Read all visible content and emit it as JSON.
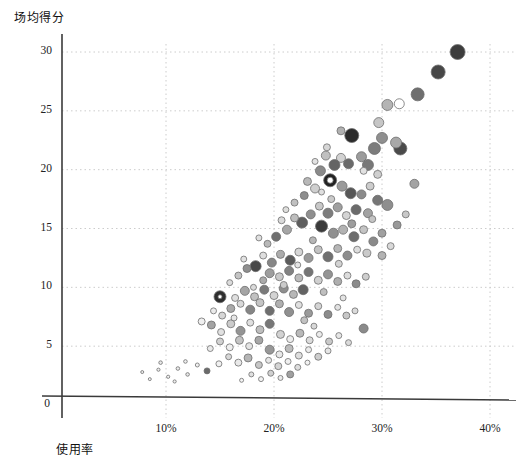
{
  "chart_data": {
    "type": "scatter",
    "title": "",
    "subtitle": "",
    "xlabel": "使用率",
    "ylabel": "场均得分",
    "xlim": [
      0.045,
      0.425
    ],
    "ylim": [
      0,
      31.5
    ],
    "grid": true,
    "legend": "none",
    "x_ticks": [
      "10%",
      "20%",
      "30%",
      "40%"
    ],
    "x_tick_values": [
      0.1,
      0.2,
      0.3,
      0.4
    ],
    "y_ticks": [
      "0",
      "5",
      "10",
      "15",
      "20",
      "25",
      "30"
    ],
    "y_tick_values": [
      0,
      5,
      10,
      15,
      20,
      25,
      30
    ],
    "marker_note": "bubble sizes vary by minutes played; grayscale fill varies per point",
    "colors": {
      "background": "#ffffff",
      "axis": "#3a3a3a",
      "grid": "#cccccc",
      "text": "#1a1a1a",
      "marker_dark": "#2f2f2f",
      "marker_mid": "#8c8c8c",
      "marker_light": "#d8d8d8",
      "marker_stroke": "#6e6e6e"
    },
    "points": [
      {
        "x": 0.37,
        "y": 30.0,
        "r": 7.5,
        "c": "#3d3d3d"
      },
      {
        "x": 0.352,
        "y": 28.3,
        "r": 7.0,
        "c": "#474747"
      },
      {
        "x": 0.333,
        "y": 26.4,
        "r": 6.5,
        "c": "#6f6f6f"
      },
      {
        "x": 0.316,
        "y": 25.6,
        "r": 5.0,
        "c": "#ffffff"
      },
      {
        "x": 0.305,
        "y": 25.5,
        "r": 5.5,
        "c": "#b4b4b4"
      },
      {
        "x": 0.297,
        "y": 24.0,
        "r": 5.0,
        "c": "#c6c6c6"
      },
      {
        "x": 0.3,
        "y": 22.7,
        "r": 5.5,
        "c": "#8f8f8f"
      },
      {
        "x": 0.293,
        "y": 21.8,
        "r": 6.0,
        "c": "#7c7c7c"
      },
      {
        "x": 0.317,
        "y": 21.8,
        "r": 6.5,
        "c": "#4a4a4a"
      },
      {
        "x": 0.313,
        "y": 22.3,
        "r": 5.5,
        "c": "#a8a8a8"
      },
      {
        "x": 0.272,
        "y": 22.9,
        "r": 7.0,
        "c": "#2b2b2b"
      },
      {
        "x": 0.281,
        "y": 21.1,
        "r": 5.0,
        "c": "#9c9c9c"
      },
      {
        "x": 0.287,
        "y": 20.4,
        "r": 5.5,
        "c": "#787878"
      },
      {
        "x": 0.269,
        "y": 20.5,
        "r": 5.0,
        "c": "#6a6a6a"
      },
      {
        "x": 0.262,
        "y": 21.0,
        "r": 4.5,
        "c": "#d2d2d2"
      },
      {
        "x": 0.256,
        "y": 20.4,
        "r": 5.5,
        "c": "#646464"
      },
      {
        "x": 0.248,
        "y": 21.2,
        "r": 4.5,
        "c": "#c0c0c0"
      },
      {
        "x": 0.243,
        "y": 19.9,
        "r": 5.0,
        "c": "#8a8a8a"
      },
      {
        "x": 0.252,
        "y": 19.1,
        "r": 6.5,
        "c": "#222222"
      },
      {
        "x": 0.252,
        "y": 19.1,
        "r": 3.0,
        "c": "#ffffff"
      },
      {
        "x": 0.238,
        "y": 18.4,
        "r": 4.5,
        "c": "#cfcfcf"
      },
      {
        "x": 0.231,
        "y": 19.0,
        "r": 4.0,
        "c": "#b8b8b8"
      },
      {
        "x": 0.263,
        "y": 18.6,
        "r": 5.0,
        "c": "#9a9a9a"
      },
      {
        "x": 0.271,
        "y": 18.0,
        "r": 5.5,
        "c": "#575757"
      },
      {
        "x": 0.281,
        "y": 17.9,
        "r": 4.5,
        "c": "#8b8b8b"
      },
      {
        "x": 0.289,
        "y": 18.6,
        "r": 4.0,
        "c": "#cdcdcd"
      },
      {
        "x": 0.296,
        "y": 17.4,
        "r": 5.0,
        "c": "#767676"
      },
      {
        "x": 0.305,
        "y": 17.0,
        "r": 5.5,
        "c": "#8e8e8e"
      },
      {
        "x": 0.287,
        "y": 16.3,
        "r": 4.5,
        "c": "#a2a2a2"
      },
      {
        "x": 0.276,
        "y": 16.6,
        "r": 5.0,
        "c": "#6b6b6b"
      },
      {
        "x": 0.267,
        "y": 16.1,
        "r": 4.0,
        "c": "#d4d4d4"
      },
      {
        "x": 0.259,
        "y": 16.8,
        "r": 4.5,
        "c": "#9f9f9f"
      },
      {
        "x": 0.25,
        "y": 16.3,
        "r": 5.0,
        "c": "#7d7d7d"
      },
      {
        "x": 0.242,
        "y": 16.9,
        "r": 4.0,
        "c": "#c8c8c8"
      },
      {
        "x": 0.234,
        "y": 16.2,
        "r": 4.5,
        "c": "#8f8f8f"
      },
      {
        "x": 0.226,
        "y": 15.5,
        "r": 5.5,
        "c": "#5e5e5e"
      },
      {
        "x": 0.219,
        "y": 15.9,
        "r": 4.0,
        "c": "#bdbdbd"
      },
      {
        "x": 0.212,
        "y": 14.9,
        "r": 4.5,
        "c": "#a6a6a6"
      },
      {
        "x": 0.207,
        "y": 15.7,
        "r": 3.5,
        "c": "#dadada"
      },
      {
        "x": 0.244,
        "y": 15.2,
        "r": 6.0,
        "c": "#3a3a3a"
      },
      {
        "x": 0.255,
        "y": 14.6,
        "r": 5.0,
        "c": "#909090"
      },
      {
        "x": 0.264,
        "y": 14.9,
        "r": 4.5,
        "c": "#b2b2b2"
      },
      {
        "x": 0.274,
        "y": 14.3,
        "r": 5.0,
        "c": "#6d6d6d"
      },
      {
        "x": 0.283,
        "y": 14.9,
        "r": 4.0,
        "c": "#c4c4c4"
      },
      {
        "x": 0.292,
        "y": 13.9,
        "r": 4.5,
        "c": "#8a8a8a"
      },
      {
        "x": 0.3,
        "y": 14.6,
        "r": 4.0,
        "c": "#a0a0a0"
      },
      {
        "x": 0.286,
        "y": 12.9,
        "r": 4.0,
        "c": "#cacaca"
      },
      {
        "x": 0.277,
        "y": 13.2,
        "r": 3.5,
        "c": "#dddddd"
      },
      {
        "x": 0.268,
        "y": 12.7,
        "r": 4.5,
        "c": "#8d8d8d"
      },
      {
        "x": 0.259,
        "y": 13.3,
        "r": 4.0,
        "c": "#b6b6b6"
      },
      {
        "x": 0.25,
        "y": 12.6,
        "r": 5.0,
        "c": "#707070"
      },
      {
        "x": 0.241,
        "y": 13.2,
        "r": 4.0,
        "c": "#c2c2c2"
      },
      {
        "x": 0.232,
        "y": 12.5,
        "r": 4.5,
        "c": "#999999"
      },
      {
        "x": 0.223,
        "y": 13.0,
        "r": 4.0,
        "c": "#d6d6d6"
      },
      {
        "x": 0.215,
        "y": 12.3,
        "r": 5.0,
        "c": "#5b5b5b"
      },
      {
        "x": 0.206,
        "y": 12.8,
        "r": 4.0,
        "c": "#acacac"
      },
      {
        "x": 0.198,
        "y": 12.1,
        "r": 4.5,
        "c": "#868686"
      },
      {
        "x": 0.19,
        "y": 12.7,
        "r": 3.5,
        "c": "#dedede"
      },
      {
        "x": 0.183,
        "y": 11.8,
        "r": 5.5,
        "c": "#494949"
      },
      {
        "x": 0.196,
        "y": 11.2,
        "r": 4.5,
        "c": "#9e9e9e"
      },
      {
        "x": 0.205,
        "y": 10.9,
        "r": 4.0,
        "c": "#c9c9c9"
      },
      {
        "x": 0.214,
        "y": 11.4,
        "r": 4.5,
        "c": "#828282"
      },
      {
        "x": 0.223,
        "y": 10.8,
        "r": 4.0,
        "c": "#bbbbbb"
      },
      {
        "x": 0.232,
        "y": 11.3,
        "r": 4.5,
        "c": "#757575"
      },
      {
        "x": 0.241,
        "y": 10.6,
        "r": 4.0,
        "c": "#d0d0d0"
      },
      {
        "x": 0.25,
        "y": 11.1,
        "r": 4.5,
        "c": "#949494"
      },
      {
        "x": 0.259,
        "y": 10.5,
        "r": 4.0,
        "c": "#aeaeae"
      },
      {
        "x": 0.268,
        "y": 11.0,
        "r": 3.5,
        "c": "#dcdcdc"
      },
      {
        "x": 0.276,
        "y": 10.3,
        "r": 4.0,
        "c": "#8b8b8b"
      },
      {
        "x": 0.285,
        "y": 10.9,
        "r": 3.5,
        "c": "#cecece"
      },
      {
        "x": 0.227,
        "y": 9.8,
        "r": 5.0,
        "c": "#636363"
      },
      {
        "x": 0.218,
        "y": 9.4,
        "r": 4.0,
        "c": "#b7b7b7"
      },
      {
        "x": 0.209,
        "y": 9.9,
        "r": 4.5,
        "c": "#8f8f8f"
      },
      {
        "x": 0.2,
        "y": 9.3,
        "r": 4.0,
        "c": "#d3d3d3"
      },
      {
        "x": 0.191,
        "y": 9.8,
        "r": 4.5,
        "c": "#7a7a7a"
      },
      {
        "x": 0.182,
        "y": 9.2,
        "r": 4.0,
        "c": "#c1c1c1"
      },
      {
        "x": 0.173,
        "y": 9.7,
        "r": 4.5,
        "c": "#a5a5a5"
      },
      {
        "x": 0.164,
        "y": 9.1,
        "r": 3.5,
        "c": "#dfdfdf"
      },
      {
        "x": 0.15,
        "y": 9.2,
        "r": 6.0,
        "c": "#2e2e2e"
      },
      {
        "x": 0.15,
        "y": 9.2,
        "r": 2.0,
        "c": "#ffffff"
      },
      {
        "x": 0.16,
        "y": 8.2,
        "r": 4.0,
        "c": "#a9a9a9"
      },
      {
        "x": 0.169,
        "y": 8.6,
        "r": 3.5,
        "c": "#d8d8d8"
      },
      {
        "x": 0.178,
        "y": 8.1,
        "r": 4.5,
        "c": "#858585"
      },
      {
        "x": 0.187,
        "y": 8.7,
        "r": 4.0,
        "c": "#c5c5c5"
      },
      {
        "x": 0.196,
        "y": 8.0,
        "r": 4.5,
        "c": "#6e6e6e"
      },
      {
        "x": 0.205,
        "y": 8.6,
        "r": 4.0,
        "c": "#b0b0b0"
      },
      {
        "x": 0.214,
        "y": 7.9,
        "r": 4.5,
        "c": "#909090"
      },
      {
        "x": 0.223,
        "y": 8.5,
        "r": 3.5,
        "c": "#e0e0e0"
      },
      {
        "x": 0.232,
        "y": 7.8,
        "r": 4.0,
        "c": "#9b9b9b"
      },
      {
        "x": 0.241,
        "y": 8.4,
        "r": 3.5,
        "c": "#d5d5d5"
      },
      {
        "x": 0.25,
        "y": 7.7,
        "r": 4.0,
        "c": "#8c8c8c"
      },
      {
        "x": 0.259,
        "y": 8.3,
        "r": 3.0,
        "c": "#e2e2e2"
      },
      {
        "x": 0.267,
        "y": 7.6,
        "r": 3.5,
        "c": "#c7c7c7"
      },
      {
        "x": 0.275,
        "y": 8.0,
        "r": 3.0,
        "c": "#dbdbdb"
      },
      {
        "x": 0.283,
        "y": 6.5,
        "r": 4.5,
        "c": "#8a8a8a"
      },
      {
        "x": 0.196,
        "y": 6.9,
        "r": 4.5,
        "c": "#777777"
      },
      {
        "x": 0.187,
        "y": 6.4,
        "r": 4.0,
        "c": "#bebebe"
      },
      {
        "x": 0.178,
        "y": 7.0,
        "r": 3.5,
        "c": "#dfdfdf"
      },
      {
        "x": 0.169,
        "y": 6.3,
        "r": 4.5,
        "c": "#949494"
      },
      {
        "x": 0.16,
        "y": 6.9,
        "r": 4.0,
        "c": "#cbcbcb"
      },
      {
        "x": 0.151,
        "y": 6.2,
        "r": 3.5,
        "c": "#e1e1e1"
      },
      {
        "x": 0.142,
        "y": 6.8,
        "r": 4.0,
        "c": "#a3a3a3"
      },
      {
        "x": 0.133,
        "y": 7.1,
        "r": 3.5,
        "c": "#f0f0f0"
      },
      {
        "x": 0.206,
        "y": 6.0,
        "r": 4.0,
        "c": "#d2d2d2"
      },
      {
        "x": 0.215,
        "y": 5.6,
        "r": 3.5,
        "c": "#ededed"
      },
      {
        "x": 0.224,
        "y": 6.1,
        "r": 4.0,
        "c": "#b9b9b9"
      },
      {
        "x": 0.233,
        "y": 5.5,
        "r": 3.5,
        "c": "#dcdcdc"
      },
      {
        "x": 0.242,
        "y": 6.0,
        "r": 3.0,
        "c": "#ebebeb"
      },
      {
        "x": 0.251,
        "y": 5.4,
        "r": 3.5,
        "c": "#c9c9c9"
      },
      {
        "x": 0.26,
        "y": 5.9,
        "r": 3.0,
        "c": "#e6e6e6"
      },
      {
        "x": 0.269,
        "y": 5.3,
        "r": 3.0,
        "c": "#dadada"
      },
      {
        "x": 0.186,
        "y": 5.5,
        "r": 4.0,
        "c": "#a7a7a7"
      },
      {
        "x": 0.177,
        "y": 5.0,
        "r": 3.5,
        "c": "#e4e4e4"
      },
      {
        "x": 0.168,
        "y": 5.5,
        "r": 4.0,
        "c": "#c3c3c3"
      },
      {
        "x": 0.159,
        "y": 4.9,
        "r": 3.5,
        "c": "#efefef"
      },
      {
        "x": 0.15,
        "y": 5.4,
        "r": 3.5,
        "c": "#d1d1d1"
      },
      {
        "x": 0.141,
        "y": 4.8,
        "r": 3.0,
        "c": "#eaeaea"
      },
      {
        "x": 0.196,
        "y": 4.7,
        "r": 4.5,
        "c": "#979797"
      },
      {
        "x": 0.205,
        "y": 4.3,
        "r": 3.5,
        "c": "#e8e8e8"
      },
      {
        "x": 0.214,
        "y": 4.8,
        "r": 4.0,
        "c": "#bcbcbc"
      },
      {
        "x": 0.223,
        "y": 4.2,
        "r": 3.5,
        "c": "#dedede"
      },
      {
        "x": 0.232,
        "y": 4.7,
        "r": 3.0,
        "c": "#ececec"
      },
      {
        "x": 0.241,
        "y": 4.1,
        "r": 3.5,
        "c": "#cdcdcd"
      },
      {
        "x": 0.25,
        "y": 4.6,
        "r": 3.0,
        "c": "#e5e5e5"
      },
      {
        "x": 0.176,
        "y": 4.0,
        "r": 4.0,
        "c": "#b5b5b5"
      },
      {
        "x": 0.167,
        "y": 3.6,
        "r": 3.5,
        "c": "#e9e9e9"
      },
      {
        "x": 0.158,
        "y": 4.1,
        "r": 3.0,
        "c": "#d7d7d7"
      },
      {
        "x": 0.149,
        "y": 3.5,
        "r": 3.0,
        "c": "#f1f1f1"
      },
      {
        "x": 0.186,
        "y": 3.4,
        "r": 3.5,
        "c": "#c6c6c6"
      },
      {
        "x": 0.195,
        "y": 3.8,
        "r": 3.0,
        "c": "#e7e7e7"
      },
      {
        "x": 0.204,
        "y": 3.3,
        "r": 3.5,
        "c": "#d4d4d4"
      },
      {
        "x": 0.213,
        "y": 3.7,
        "r": 3.0,
        "c": "#efefef"
      },
      {
        "x": 0.222,
        "y": 3.2,
        "r": 3.0,
        "c": "#dddddd"
      },
      {
        "x": 0.231,
        "y": 3.6,
        "r": 2.5,
        "c": "#f2f2f2"
      },
      {
        "x": 0.215,
        "y": 2.6,
        "r": 3.5,
        "c": "#a0a0a0"
      },
      {
        "x": 0.206,
        "y": 2.3,
        "r": 2.5,
        "c": "#ebebeb"
      },
      {
        "x": 0.197,
        "y": 2.7,
        "r": 3.0,
        "c": "#d0d0d0"
      },
      {
        "x": 0.188,
        "y": 2.2,
        "r": 2.5,
        "c": "#f3f3f3"
      },
      {
        "x": 0.179,
        "y": 2.6,
        "r": 2.5,
        "c": "#e0e0e0"
      },
      {
        "x": 0.17,
        "y": 2.1,
        "r": 2.0,
        "c": "#f4f4f4"
      },
      {
        "x": 0.138,
        "y": 2.9,
        "r": 3.0,
        "c": "#6a6a6a"
      },
      {
        "x": 0.129,
        "y": 3.4,
        "r": 2.0,
        "c": "#f0f0f0"
      },
      {
        "x": 0.12,
        "y": 2.6,
        "r": 1.8,
        "c": "#e8e8e8"
      },
      {
        "x": 0.111,
        "y": 3.1,
        "r": 1.8,
        "c": "#ededed"
      },
      {
        "x": 0.102,
        "y": 2.4,
        "r": 1.6,
        "c": "#f2f2f2"
      },
      {
        "x": 0.093,
        "y": 3.0,
        "r": 1.6,
        "c": "#eeeeee"
      },
      {
        "x": 0.085,
        "y": 2.2,
        "r": 1.5,
        "c": "#f1f1f1"
      },
      {
        "x": 0.078,
        "y": 2.8,
        "r": 1.5,
        "c": "#ebebeb"
      },
      {
        "x": 0.095,
        "y": 3.6,
        "r": 1.8,
        "c": "#e9e9e9"
      },
      {
        "x": 0.108,
        "y": 2.0,
        "r": 1.6,
        "c": "#f0f0f0"
      },
      {
        "x": 0.118,
        "y": 3.7,
        "r": 1.8,
        "c": "#efefef"
      },
      {
        "x": 0.3,
        "y": 12.7,
        "r": 4.0,
        "c": "#b3b3b3"
      },
      {
        "x": 0.308,
        "y": 13.5,
        "r": 3.5,
        "c": "#d9d9d9"
      },
      {
        "x": 0.314,
        "y": 15.3,
        "r": 4.0,
        "c": "#999999"
      },
      {
        "x": 0.322,
        "y": 16.2,
        "r": 3.5,
        "c": "#c8c8c8"
      },
      {
        "x": 0.33,
        "y": 18.8,
        "r": 4.5,
        "c": "#a4a4a4"
      },
      {
        "x": 0.296,
        "y": 19.6,
        "r": 4.0,
        "c": "#cfcfcf"
      },
      {
        "x": 0.283,
        "y": 19.9,
        "r": 3.5,
        "c": "#e1e1e1"
      },
      {
        "x": 0.262,
        "y": 23.3,
        "r": 4.0,
        "c": "#b1b1b1"
      },
      {
        "x": 0.249,
        "y": 21.9,
        "r": 3.5,
        "c": "#d6d6d6"
      },
      {
        "x": 0.238,
        "y": 20.7,
        "r": 3.0,
        "c": "#e3e3e3"
      },
      {
        "x": 0.228,
        "y": 17.8,
        "r": 4.0,
        "c": "#8d8d8d"
      },
      {
        "x": 0.219,
        "y": 17.2,
        "r": 3.5,
        "c": "#c0c0c0"
      },
      {
        "x": 0.211,
        "y": 16.6,
        "r": 3.0,
        "c": "#dededc"
      },
      {
        "x": 0.202,
        "y": 14.3,
        "r": 4.5,
        "c": "#707070"
      },
      {
        "x": 0.194,
        "y": 13.7,
        "r": 3.5,
        "c": "#b8b8b8"
      },
      {
        "x": 0.186,
        "y": 14.2,
        "r": 3.0,
        "c": "#e0e0e0"
      },
      {
        "x": 0.175,
        "y": 11.6,
        "r": 4.0,
        "c": "#8f8f8f"
      },
      {
        "x": 0.167,
        "y": 11.0,
        "r": 3.5,
        "c": "#c4c4c4"
      },
      {
        "x": 0.159,
        "y": 10.4,
        "r": 3.0,
        "c": "#dcdcdc"
      },
      {
        "x": 0.152,
        "y": 7.6,
        "r": 3.5,
        "c": "#d7d7d7"
      },
      {
        "x": 0.144,
        "y": 8.0,
        "r": 3.0,
        "c": "#ebebeb"
      },
      {
        "x": 0.253,
        "y": 17.5,
        "r": 3.5,
        "c": "#cacaca"
      },
      {
        "x": 0.244,
        "y": 18.1,
        "r": 3.0,
        "c": "#dfdfdf"
      },
      {
        "x": 0.272,
        "y": 15.4,
        "r": 4.0,
        "c": "#9d9d9d"
      },
      {
        "x": 0.291,
        "y": 15.8,
        "r": 3.5,
        "c": "#c5c5c5"
      },
      {
        "x": 0.236,
        "y": 14.0,
        "r": 3.5,
        "c": "#b6b6b6"
      },
      {
        "x": 0.26,
        "y": 12.0,
        "r": 3.5,
        "c": "#d3d3d3"
      },
      {
        "x": 0.222,
        "y": 11.9,
        "r": 3.0,
        "c": "#e5e5e5"
      },
      {
        "x": 0.209,
        "y": 10.2,
        "r": 3.5,
        "c": "#cbcbcb"
      },
      {
        "x": 0.246,
        "y": 9.6,
        "r": 3.5,
        "c": "#bfbfbf"
      },
      {
        "x": 0.264,
        "y": 9.1,
        "r": 3.0,
        "c": "#e4e4e4"
      },
      {
        "x": 0.237,
        "y": 6.7,
        "r": 3.0,
        "c": "#d8d8d8"
      },
      {
        "x": 0.228,
        "y": 7.2,
        "r": 3.5,
        "c": "#c2c2c2"
      },
      {
        "x": 0.19,
        "y": 10.6,
        "r": 3.5,
        "c": "#ababab"
      },
      {
        "x": 0.181,
        "y": 10.0,
        "r": 3.0,
        "c": "#dadada"
      },
      {
        "x": 0.172,
        "y": 12.4,
        "r": 3.0,
        "c": "#e2e2e2"
      },
      {
        "x": 0.163,
        "y": 7.4,
        "r": 3.0,
        "c": "#e7e7e7"
      }
    ]
  }
}
